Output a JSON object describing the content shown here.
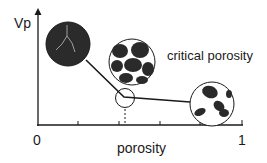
{
  "diagram": {
    "y_axis_label": "Vp",
    "x_axis_label": "porosity",
    "x_tick_min": "0",
    "x_tick_max": "1",
    "annotation": "critical porosity",
    "colors": {
      "ink": "#1a1a1a",
      "grain": "#2a2a2a",
      "background": "#ffffff"
    },
    "elements": [
      {
        "name": "low-porosity-rock",
        "desc": "solid dark circle with crack"
      },
      {
        "name": "critical-porosity-grains",
        "desc": "packed grains circle"
      },
      {
        "name": "critical-point-marker",
        "desc": "small circle at kink"
      },
      {
        "name": "suspension-grains",
        "desc": "sparse grains circle"
      }
    ]
  }
}
